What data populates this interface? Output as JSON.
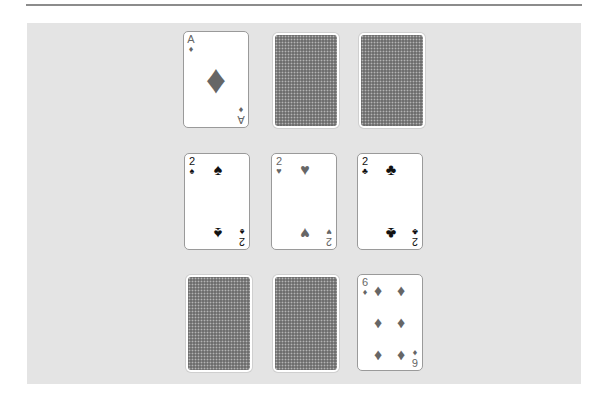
{
  "game": {
    "title": "Card Memory Table",
    "colors": {
      "table": "#e4e4e4",
      "card_back": "#6e6e6e",
      "red_suit": "#666666",
      "black_suit": "#111111"
    },
    "cards": [
      {
        "row": 1,
        "col": 1,
        "state": "face-up",
        "rank": "A",
        "suit": "diamonds",
        "suit_glyph": "♦"
      },
      {
        "row": 1,
        "col": 2,
        "state": "face-down"
      },
      {
        "row": 1,
        "col": 3,
        "state": "face-down"
      },
      {
        "row": 2,
        "col": 1,
        "state": "face-up",
        "rank": "2",
        "suit": "spades",
        "suit_glyph": "♠"
      },
      {
        "row": 2,
        "col": 2,
        "state": "face-up",
        "rank": "2",
        "suit": "hearts",
        "suit_glyph": "♥"
      },
      {
        "row": 2,
        "col": 3,
        "state": "face-up",
        "rank": "2",
        "suit": "clubs",
        "suit_glyph": "♣"
      },
      {
        "row": 3,
        "col": 1,
        "state": "face-down"
      },
      {
        "row": 3,
        "col": 2,
        "state": "face-down"
      },
      {
        "row": 3,
        "col": 3,
        "state": "face-up",
        "rank": "6",
        "suit": "diamonds",
        "suit_glyph": "♦"
      }
    ]
  }
}
